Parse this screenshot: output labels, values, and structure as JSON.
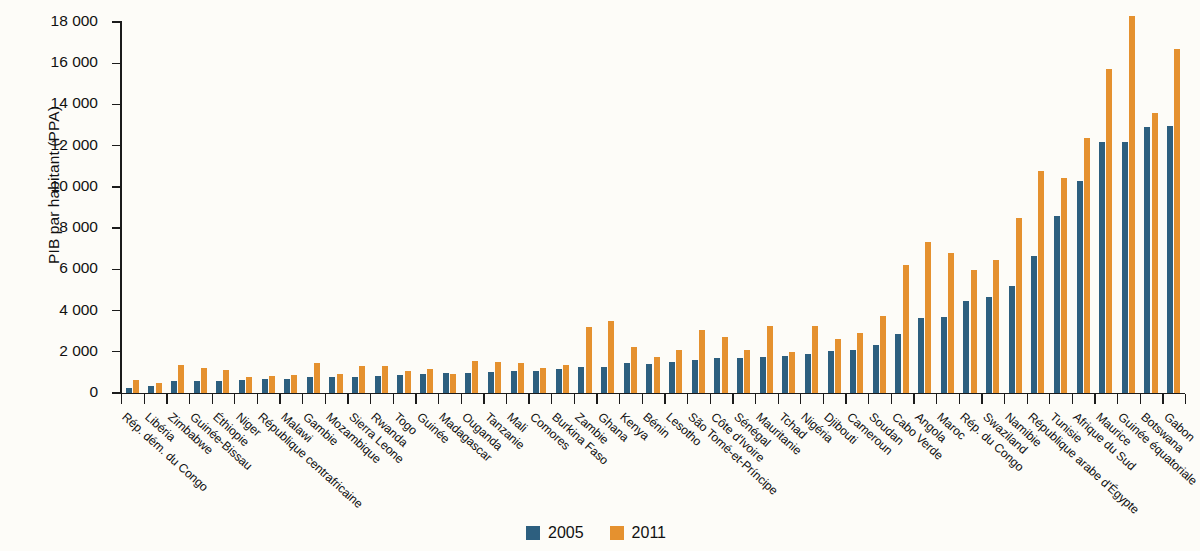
{
  "chart_data": {
    "type": "bar",
    "title": "",
    "xlabel": "",
    "ylabel": "PIB par habitant (PPA)",
    "ylim": [
      0,
      18000
    ],
    "ytick_step": 2000,
    "ytick_labels": [
      "0",
      "2 000",
      "4 000",
      "6 000",
      "8 000",
      "10 000",
      "12 000",
      "14 000",
      "16 000",
      "18 000"
    ],
    "grid": false,
    "legend_position": "bottom-center",
    "colors": {
      "2005": "#2d5f7f",
      "2011": "#e5912f"
    },
    "categories": [
      "Rép. dém. du Congo",
      "Libéria",
      "Zimbabwe",
      "Guinée-Bissau",
      "Éthiopie",
      "Niger",
      "République centrafricaine",
      "Malawi",
      "Gambie",
      "Mozambique",
      "Sierra Leone",
      "Rwanda",
      "Togo",
      "Guinée",
      "Madagascar",
      "Ouganda",
      "Tanzanie",
      "Mali",
      "Comores",
      "Burkina Faso",
      "Zambie",
      "Ghana",
      "Kenya",
      "Bénin",
      "Lesotho",
      "São Tomé-et-Príncipe",
      "Côte d'Ivoire",
      "Sénégal",
      "Mauritanie",
      "Tchad",
      "Nigéria",
      "Djibouti",
      "Cameroun",
      "Soudan",
      "Cabo Verde",
      "Angola",
      "Maroc",
      "Rép. du Congo",
      "Swaziland",
      "Namibie",
      "République arabe d'Égypte",
      "Tunisie",
      "Afrique du Sud",
      "Maurice",
      "Guinée équatoriale",
      "Botswana",
      "Gabon"
    ],
    "series": [
      {
        "name": "2005",
        "color": "#2d5f7f",
        "values": [
          230,
          330,
          560,
          560,
          580,
          610,
          700,
          700,
          760,
          760,
          800,
          830,
          880,
          920,
          950,
          960,
          1020,
          1050,
          1080,
          1180,
          1250,
          1270,
          1440,
          1430,
          1520,
          1600,
          1680,
          1720,
          1740,
          1780,
          1900,
          2030,
          2080,
          2320,
          2880,
          3640,
          3700,
          4480,
          4680,
          5200,
          6640,
          8600,
          10300,
          12200,
          12200,
          12900,
          12950
        ]
      },
      {
        "name": "2011",
        "color": "#e5912f",
        "values": [
          620,
          480,
          1340,
          1230,
          1100,
          780,
          810,
          860,
          1470,
          940,
          1330,
          1290,
          1050,
          1170,
          930,
          1540,
          1490,
          1450,
          1220,
          1340,
          3200,
          3480,
          2240,
          1750,
          2100,
          3080,
          2710,
          2110,
          3260,
          2000,
          3250,
          2630,
          2890,
          3720,
          6200,
          7350,
          6810,
          5960,
          6450,
          8470,
          10750,
          10450,
          12350,
          15720,
          18300,
          13600,
          16700
        ]
      }
    ]
  },
  "legend": {
    "items": [
      {
        "label": "2005",
        "color": "#2d5f7f"
      },
      {
        "label": "2011",
        "color": "#e5912f"
      }
    ]
  },
  "axis": {
    "y_title": "PIB par habitant (PPA)"
  }
}
